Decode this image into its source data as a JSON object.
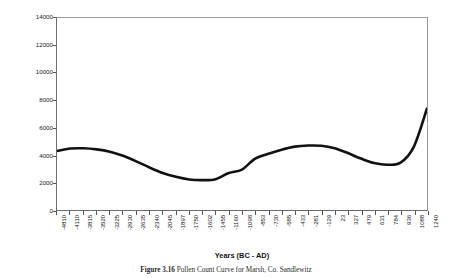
{
  "figure": {
    "caption_bold": "Figure 3.16",
    "caption_rest": "Pollen Count Curve for Marsh, Co. Sandlewitz"
  },
  "chart_data": {
    "type": "line",
    "title": "",
    "xlabel": "Years (BC - AD)",
    "ylabel": "Arboreal Pollen Count",
    "ylim": [
      0,
      14000
    ],
    "y_ticks": [
      0,
      2000,
      4000,
      6000,
      8000,
      10000,
      12000,
      14000
    ],
    "grid": false,
    "legend": "none",
    "line_color": "#111111",
    "line_width": 2.6,
    "categories": [
      "-4810",
      "-4110",
      "-3815",
      "-3520",
      "-3225",
      "-2930",
      "-2635",
      "-2340",
      "-2045",
      "-1897",
      "-1750",
      "-1602",
      "-1455",
      "-1160",
      "-1098",
      "-853",
      "-730",
      "-585",
      "-433",
      "-281",
      "-129",
      "23",
      "327",
      "479",
      "631",
      "784",
      "936",
      "1088",
      "1240"
    ],
    "values": [
      4300,
      4480,
      4500,
      4420,
      4250,
      3950,
      3550,
      3100,
      2700,
      2420,
      2230,
      2180,
      2250,
      2700,
      2950,
      3750,
      4100,
      4400,
      4620,
      4700,
      4680,
      4500,
      4150,
      3750,
      3420,
      3300,
      3450,
      4600,
      7400
    ]
  }
}
